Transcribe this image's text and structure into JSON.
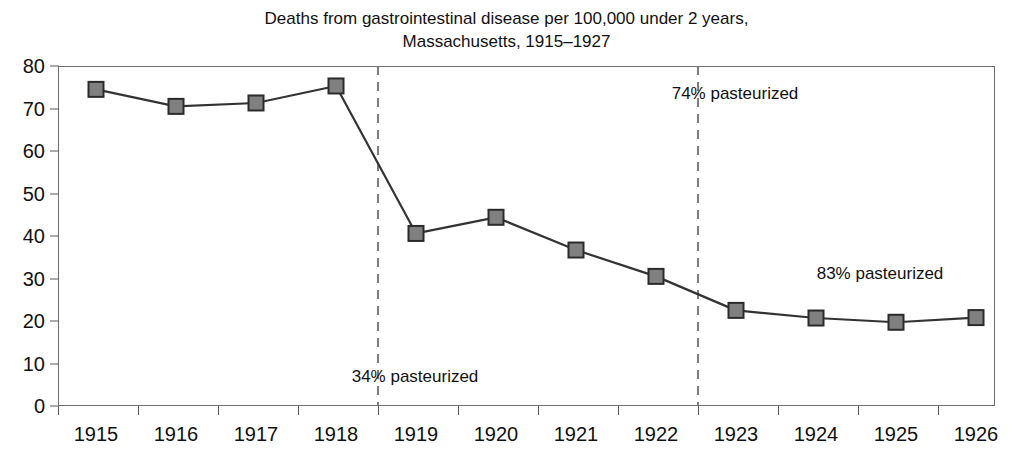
{
  "chart_data": {
    "type": "line",
    "title": "Deaths from gastrointestinal disease per 100,000 under 2 years,\nMassachusetts, 1915–1927",
    "title_line1": "Deaths from gastrointestinal disease per 100,000 under 2 years,",
    "title_line2": "Massachusetts, 1915–1927",
    "xlabel": "",
    "ylabel": "",
    "categories": [
      "1915",
      "1916",
      "1917",
      "1918",
      "1919",
      "1920",
      "1921",
      "1922",
      "1923",
      "1924",
      "1925",
      "1926"
    ],
    "values": [
      74.5,
      70.5,
      71.3,
      75.3,
      40.6,
      44.4,
      36.7,
      30.5,
      22.5,
      20.7,
      19.7,
      20.8
    ],
    "ylim": [
      0,
      80
    ],
    "y_ticks": [
      0,
      10,
      20,
      30,
      40,
      50,
      60,
      70,
      80
    ],
    "y_tick_labels": [
      "0",
      "10",
      "20",
      "30",
      "40",
      "50",
      "60",
      "70",
      "80"
    ],
    "grid": false,
    "legend": "none",
    "marker": "square",
    "series_color": "#333333",
    "marker_fill": "#808080",
    "marker_edge": "#2b2b2b",
    "annotations": [
      {
        "text": "34% pasteurized",
        "x_category": "1919",
        "x_px": 415,
        "y_px": 377
      },
      {
        "text": "74% pasteurized",
        "x_category": "1923",
        "x_px": 735,
        "y_px": 94
      },
      {
        "text": "83% pasteurized",
        "x_category": "1924",
        "x_px": 880,
        "y_px": 274
      }
    ],
    "reference_lines": [
      {
        "x_category": "1919",
        "style": "dashed",
        "color": "#6f6f6f"
      },
      {
        "x_category": "1923",
        "style": "dashed",
        "color": "#6f6f6f"
      }
    ]
  }
}
